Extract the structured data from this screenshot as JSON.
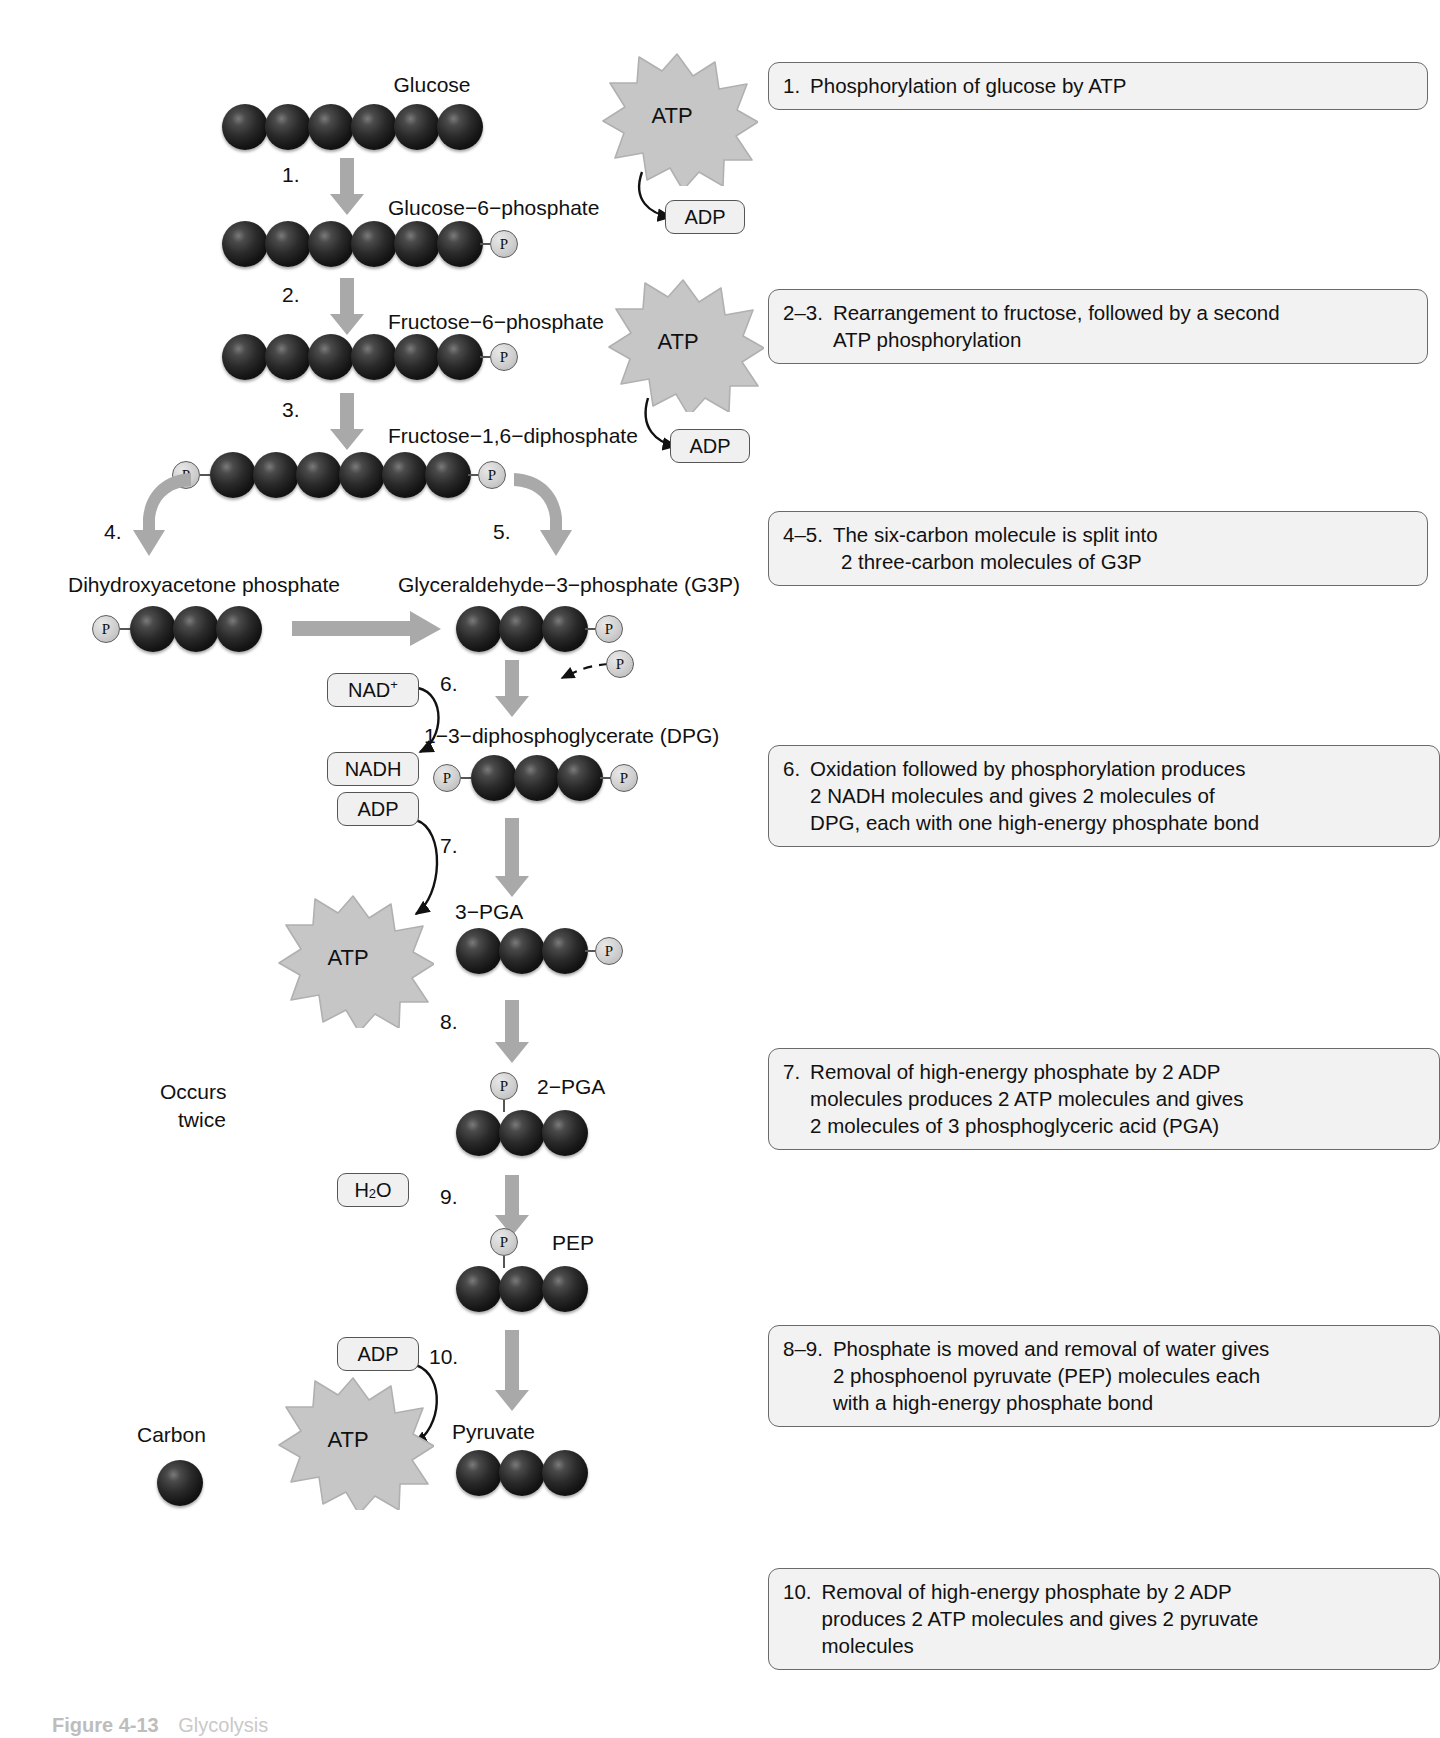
{
  "figure": {
    "title": "Glycolysis",
    "caption_label": "Figure 4-13",
    "caption_text": "Glycolysis"
  },
  "legend": {
    "carbon_label": "Carbon",
    "occurs_twice": "Occurs\ntwice",
    "occurs_twice_line1": "Occurs",
    "occurs_twice_line2": "twice"
  },
  "molecules": {
    "glucose": {
      "name": "Glucose",
      "carbons": 6,
      "phosphates": 0
    },
    "g6p": {
      "name": "Glucose−6−phosphate",
      "carbons": 6,
      "phosphate_right": true
    },
    "f6p": {
      "name": "Fructose−6−phosphate",
      "carbons": 6,
      "phosphate_right": true
    },
    "fdp": {
      "name": "Fructose−1,6−diphosphate",
      "carbons": 6,
      "phosphate_left": true,
      "phosphate_right": true
    },
    "dhap": {
      "name": "Dihydroxyacetone phosphate",
      "carbons": 3,
      "phosphate_left": true
    },
    "g3p": {
      "name": "Glyceraldehyde−3−phosphate (G3P)",
      "carbons": 3,
      "phosphate_right": true
    },
    "dpg": {
      "name": "1−3−diphosphoglycerate (DPG)",
      "carbons": 3,
      "phosphate_left": true,
      "phosphate_right": true
    },
    "pga3": {
      "name": "3−PGA",
      "carbons": 3,
      "phosphate_right": true
    },
    "pga2": {
      "name": "2−PGA",
      "carbons": 3,
      "phosphate_top": true
    },
    "pep": {
      "name": "PEP",
      "carbons": 3,
      "phosphate_top": true
    },
    "pyruvate": {
      "name": "Pyruvate",
      "carbons": 3,
      "phosphates": 0
    }
  },
  "cofactors": {
    "atp": "ATP",
    "adp": "ADP",
    "nad_plus_main": "NAD",
    "nad_plus_sup": "+",
    "nadh": "NADH",
    "water_main": "H",
    "water_sub": "2",
    "water_tail": "O",
    "free_phosphate": "P"
  },
  "step_numbers": {
    "s1": "1.",
    "s2": "2.",
    "s3": "3.",
    "s4": "4.",
    "s5": "5.",
    "s6": "6.",
    "s7": "7.",
    "s8": "8.",
    "s9": "9.",
    "s10": "10."
  },
  "callouts": [
    {
      "id": "callout-1",
      "num": "1.",
      "lines": [
        "Phosphorylation of glucose by ATP"
      ]
    },
    {
      "id": "callout-2-3",
      "num": "2–3.",
      "lines": [
        "Rearrangement to fructose, followed by a second",
        "ATP phosphorylation"
      ]
    },
    {
      "id": "callout-4-5",
      "num": "4–5.",
      "lines": [
        "The six-carbon molecule is split into",
        "2 three-carbon molecules of G3P"
      ]
    },
    {
      "id": "callout-6",
      "num": "6.",
      "lines": [
        "Oxidation followed by phosphorylation produces",
        "2 NADH molecules and gives 2 molecules of",
        "DPG, each with one high-energy phosphate bond"
      ]
    },
    {
      "id": "callout-7",
      "num": "7.",
      "lines": [
        "Removal of high-energy phosphate by 2 ADP",
        "molecules produces 2 ATP molecules and gives",
        "2 molecules of 3 phosphoglyceric acid (PGA)"
      ]
    },
    {
      "id": "callout-8-9",
      "num": "8–9.",
      "lines": [
        "Phosphate is moved and removal of water gives",
        "2 phosphoenol pyruvate (PEP) molecules each",
        "with a high-energy phosphate bond"
      ]
    },
    {
      "id": "callout-10",
      "num": "10.",
      "lines": [
        "Removal of high-energy phosphate by 2 ADP",
        "produces 2 ATP molecules and gives 2 pyruvate",
        "molecules"
      ]
    }
  ],
  "colors": {
    "carbon": "#161616",
    "phosphate_fill": "#cfcfcf",
    "arrow_gray": "#a9a9a9",
    "burst_gray": "#c6c6c6",
    "callout_fill": "#f2f2f2",
    "callout_border": "#6a6a6a",
    "pill_fill": "#f0f0f0",
    "text": "#111111",
    "background": "#ffffff"
  }
}
